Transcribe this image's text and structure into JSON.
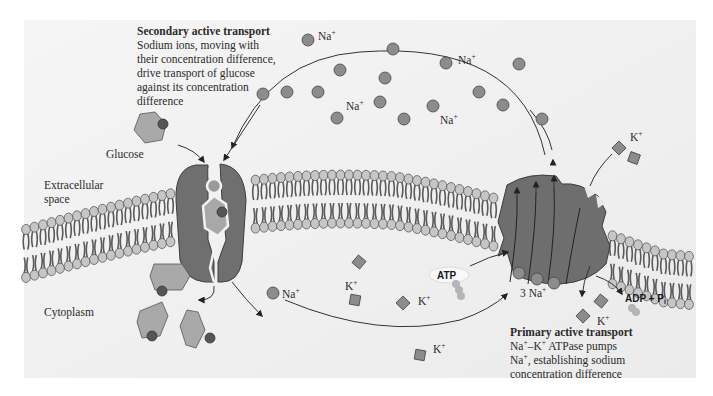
{
  "figure": {
    "background": "#f1f1f1",
    "colors": {
      "ion_sodium": "#8c8c8c",
      "ion_potassium": "#8c8c8c",
      "protein": "#6e6e6e",
      "glucose": "#a9a9a9",
      "glucose_tag": "#555555",
      "lipid_head": "#c6c6c6",
      "lipid_tail": "#5a5a5a",
      "arrow": "#333333"
    }
  },
  "regions": {
    "extracellular_line1": "Extracellular",
    "extracellular_line2": "space",
    "cytoplasm": "Cytoplasm"
  },
  "labels": {
    "glucose": "Glucose",
    "na": "Na",
    "k": "K",
    "plus": "+",
    "three_na": "3 Na",
    "atp": "ATP",
    "adp_pi": "ADP + P",
    "pi_sub": "i"
  },
  "captions": {
    "secondary": {
      "title": "Secondary active transport",
      "lines": [
        "Sodium ions, moving with",
        "their concentration difference,",
        "drive transport of glucose",
        "against its concentration",
        "difference"
      ]
    },
    "primary": {
      "title": "Primary active transport",
      "line1_a": "Na",
      "line1_b": "–K",
      "line1_c": " ATPase pumps",
      "line2_a": "Na",
      "line2_b": ", establishing sodium",
      "line3": "concentration difference"
    }
  }
}
